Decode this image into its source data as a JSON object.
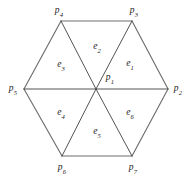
{
  "figure": {
    "type": "hexagon-triangulation-diagram",
    "background_color": "#ffffff",
    "stroke_color_outline": "#6e6e6e",
    "stroke_color_diagonal": "#4a4a4a",
    "label_color": "#1a1a1a",
    "center_point": {
      "name": "p1",
      "base": "p",
      "sub": "1",
      "x": 96,
      "y": 89
    },
    "vertices": [
      {
        "name": "p2",
        "base": "p",
        "sub": "2",
        "x": 168,
        "y": 89,
        "label_x": 178,
        "label_y": 89,
        "position": "right"
      },
      {
        "name": "p3",
        "base": "p",
        "sub": "3",
        "x": 132,
        "y": 21,
        "label_x": 134,
        "label_y": 11,
        "position": "top-right"
      },
      {
        "name": "p4",
        "base": "p",
        "sub": "4",
        "x": 61,
        "y": 21,
        "label_x": 59,
        "label_y": 11,
        "position": "top-left"
      },
      {
        "name": "p5",
        "base": "p",
        "sub": "5",
        "x": 24,
        "y": 89,
        "label_x": 13,
        "label_y": 89,
        "position": "left"
      },
      {
        "name": "p6",
        "base": "p",
        "sub": "6",
        "x": 62,
        "y": 156,
        "label_x": 62,
        "label_y": 168,
        "position": "bottom-left"
      },
      {
        "name": "p7",
        "base": "p",
        "sub": "7",
        "x": 132,
        "y": 156,
        "label_x": 133,
        "label_y": 168,
        "position": "bottom-right"
      }
    ],
    "faces": [
      {
        "name": "e1",
        "base": "e",
        "sub": "1",
        "label_x": 130,
        "label_y": 64,
        "region": "upper-right",
        "corners": [
          "p1",
          "p2",
          "p3"
        ]
      },
      {
        "name": "e2",
        "base": "e",
        "sub": "2",
        "label_x": 97,
        "label_y": 47,
        "region": "top",
        "corners": [
          "p1",
          "p3",
          "p4"
        ]
      },
      {
        "name": "e3",
        "base": "e",
        "sub": "3",
        "label_x": 61,
        "label_y": 65,
        "region": "upper-left",
        "corners": [
          "p1",
          "p4",
          "p5"
        ]
      },
      {
        "name": "e4",
        "base": "e",
        "sub": "4",
        "label_x": 61,
        "label_y": 113,
        "region": "lower-left",
        "corners": [
          "p1",
          "p5",
          "p6"
        ]
      },
      {
        "name": "e5",
        "base": "e",
        "sub": "5",
        "label_x": 97,
        "label_y": 132,
        "region": "bottom",
        "corners": [
          "p1",
          "p6",
          "p7"
        ]
      },
      {
        "name": "e6",
        "base": "e",
        "sub": "6",
        "label_x": 130,
        "label_y": 113,
        "region": "lower-right",
        "corners": [
          "p1",
          "p7",
          "p2"
        ]
      }
    ],
    "center_label": {
      "label_x": 110,
      "label_y": 78
    },
    "outline_edges": [
      [
        "p4",
        "p3"
      ],
      [
        "p3",
        "p2"
      ],
      [
        "p2",
        "p7"
      ],
      [
        "p7",
        "p6"
      ],
      [
        "p6",
        "p5"
      ],
      [
        "p5",
        "p4"
      ]
    ],
    "diagonal_edges": [
      [
        "p1",
        "p2"
      ],
      [
        "p1",
        "p3"
      ],
      [
        "p1",
        "p4"
      ],
      [
        "p1",
        "p5"
      ],
      [
        "p1",
        "p6"
      ],
      [
        "p1",
        "p7"
      ]
    ]
  }
}
